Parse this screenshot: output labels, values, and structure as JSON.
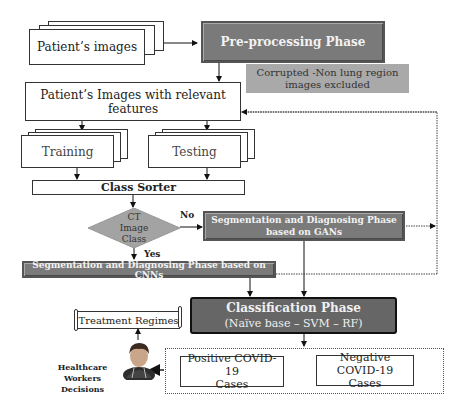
{
  "diagram": {
    "nodes": {
      "patients_images": "Patient’s images",
      "preprocessing": "Pre-processing Phase",
      "excluded_note": "Corrupted -Non lung region images excluded",
      "relevant_features": "Patient’s Images with relevant features",
      "training": "Training",
      "testing": "Testing",
      "class_sorter": "Class Sorter",
      "decision_line1": "CT",
      "decision_line2": "Image",
      "decision_line3": "Class",
      "gan_line1": "Segmentation and Diagnosing Phase",
      "gan_line2": "based on GANs",
      "cnn": "Segmentation and Diagnosing Phase based on CNNs",
      "classification_title": "Classification Phase",
      "classification_sub": "(Naïve base – SVM – RF)",
      "treatment": "Treatment Regimes",
      "hc_line1": "Healthcare Workers",
      "hc_line2": "Decisions",
      "positive_line1": "Positive COVID-19",
      "positive_line2": "Cases",
      "negative_line1": "Negative COVID-19",
      "negative_line2": "Cases"
    },
    "edge_labels": {
      "no": "No",
      "yes": "Yes"
    },
    "icons": {
      "healthcare_worker": "doctor-avatar-icon",
      "treatment_scroll": "scroll-icon"
    },
    "colors": {
      "phase_box": "#7a7a7a",
      "note_box": "#a9a9a9",
      "decision": "#a3a3a3",
      "classification": "#666666"
    }
  }
}
